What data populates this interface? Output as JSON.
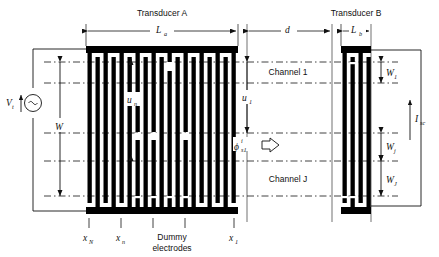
{
  "figure": {
    "type": "saw-idt-schematic",
    "title_a": "Transducer A",
    "title_b": "Transducer B",
    "labels": {
      "L_a": "L",
      "L_a_sub": "a",
      "L_b": "L",
      "L_b_sub": "b",
      "d": "d",
      "W": "W",
      "V_t": "V",
      "V_t_sub": "t",
      "I_sc": "I",
      "I_sc_sub": "sc",
      "u_1": "u",
      "u_1_sub": "1",
      "u_n": "u",
      "u_n_sub": "n",
      "phi": "ϕ",
      "phi_sup": "i",
      "phi_sub": "s1",
      "x_N": "x",
      "x_N_sub": "N",
      "x_n": "x",
      "x_n_sub": "n",
      "x_1": "x",
      "x_1_sub": "1",
      "W_1": "W",
      "W_1_sub": "1",
      "W_j": "W",
      "W_j_sub": "j",
      "W_J": "W",
      "W_J_sub": "J",
      "channel_1": "Channel 1",
      "channel_J": "Channel J",
      "dummy_line1": "Dummy",
      "dummy_line2": "electrodes"
    },
    "colors": {
      "ink": "#111111",
      "electrode": "#000000",
      "background": "#ffffff",
      "dash": "#111111"
    },
    "transducer_a": {
      "x_left": 86,
      "x_right": 238,
      "y_top": 46,
      "y_bottom": 214,
      "bus_thickness": 7,
      "finger_count": 19,
      "finger_width": 4.2,
      "finger_pitch": 8.1,
      "note": "apodized split electrodes with dummy electrodes in the middle"
    },
    "transducer_b": {
      "x_left": 341,
      "x_right": 371,
      "y_top": 46,
      "y_bottom": 214,
      "bus_thickness": 7,
      "finger_count": 3
    },
    "channel_rows_y": [
      62,
      83,
      133,
      161,
      196
    ],
    "arrow_propagation": "⇒"
  }
}
